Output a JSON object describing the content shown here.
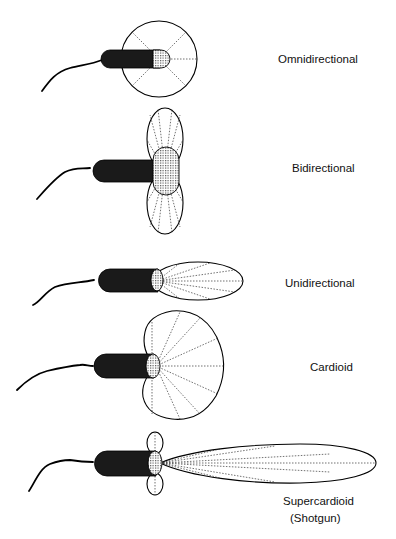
{
  "diagram": {
    "type": "microphone-polar-patterns",
    "colors": {
      "stroke": "#000000",
      "body": "#1a1a1a",
      "background": "#ffffff"
    },
    "patterns": [
      {
        "id": "omnidirectional",
        "label": "Omnidirectional"
      },
      {
        "id": "bidirectional",
        "label": "Bidirectional"
      },
      {
        "id": "unidirectional",
        "label": "Unidirectional"
      },
      {
        "id": "cardioid",
        "label": "Cardioid"
      },
      {
        "id": "supercardioid",
        "label": "Supercardioid",
        "sublabel": "(Shotgun)"
      }
    ]
  }
}
